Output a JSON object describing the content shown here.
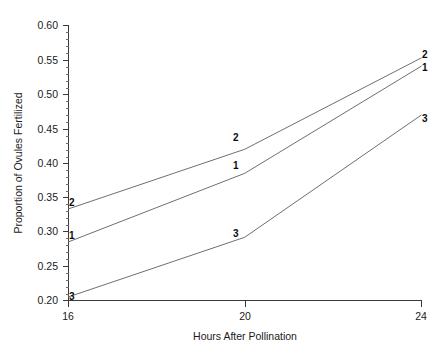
{
  "chart_data": {
    "type": "line",
    "title": "",
    "xlabel": "Hours After Pollination",
    "ylabel": "Proportion of Ovules Fertilized",
    "x": [
      16,
      20,
      24
    ],
    "xlim": [
      16,
      24
    ],
    "ylim": [
      0.2,
      0.6
    ],
    "xticks": [
      16,
      20,
      24
    ],
    "xtick_labels": [
      "16",
      "20",
      "24"
    ],
    "yticks": [
      0.2,
      0.25,
      0.3,
      0.35,
      0.4,
      0.45,
      0.5,
      0.55,
      0.6
    ],
    "ytick_labels": [
      "0.20",
      "0.25",
      "0.30",
      "0.35",
      "0.40",
      "0.45",
      "0.50",
      "0.55",
      "0.60"
    ],
    "grid": false,
    "legend": "inline-point-labels",
    "minor_ticks": true,
    "series": [
      {
        "name": "1",
        "label": "1",
        "values": [
          0.285,
          0.385,
          0.541
        ],
        "point_labels": [
          "1",
          "1",
          "1"
        ]
      },
      {
        "name": "2",
        "label": "2",
        "values": [
          0.333,
          0.42,
          0.553
        ],
        "point_labels": [
          "2",
          "2",
          "2"
        ]
      },
      {
        "name": "3",
        "label": "3",
        "values": [
          0.205,
          0.292,
          0.47
        ],
        "point_labels": [
          "3",
          "3",
          "3"
        ]
      }
    ],
    "line_color": "#6f6f6f",
    "text_color": "#1a1a1a",
    "axis_color": "#3a3a3a",
    "background": "#ffffff"
  }
}
